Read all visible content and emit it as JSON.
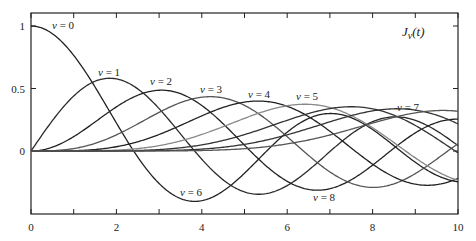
{
  "chart_data": {
    "type": "line",
    "annotation_title": "Jv(t)",
    "xlabel": "",
    "ylabel": "",
    "xlim": [
      0,
      10
    ],
    "ylim": [
      -0.5,
      1.1
    ],
    "grid": false,
    "legend": "inline labels",
    "x_ticks": [
      0,
      2,
      4,
      6,
      8,
      10
    ],
    "x_minor_ticks": [
      1,
      3,
      5,
      7,
      9
    ],
    "y_ticks": [
      {
        "value": 1,
        "label": "1"
      },
      {
        "value": 0.5,
        "label": "0.5"
      },
      {
        "value": 0,
        "label": "0"
      }
    ],
    "series": [
      {
        "name": "v = 0",
        "order": 0,
        "color": "#222222",
        "label_pos": [
          52,
          29
        ],
        "x": [
          0,
          1,
          2,
          3,
          4,
          5,
          6,
          7,
          8,
          9,
          10
        ],
        "values": [
          1.0,
          0.765,
          0.224,
          -0.26,
          -0.397,
          -0.178,
          0.151,
          0.3,
          0.172,
          -0.09,
          -0.246
        ]
      },
      {
        "name": "v = 1",
        "order": 1,
        "color": "#2a2a2a",
        "label_pos": [
          98,
          76
        ],
        "x": [
          0,
          1,
          2,
          3,
          4,
          5,
          6,
          7,
          8,
          9,
          10
        ],
        "values": [
          0.0,
          0.44,
          0.577,
          0.339,
          -0.066,
          -0.328,
          -0.277,
          -0.005,
          0.235,
          0.245,
          0.043
        ]
      },
      {
        "name": "v = 2",
        "order": 2,
        "color": "#222222",
        "label_pos": [
          150,
          85
        ],
        "x": [
          0,
          1,
          2,
          3,
          4,
          5,
          6,
          7,
          8,
          9,
          10
        ],
        "values": [
          0.0,
          0.115,
          0.353,
          0.486,
          0.364,
          0.047,
          -0.243,
          -0.301,
          -0.113,
          0.145,
          0.255
        ]
      },
      {
        "name": "v = 3",
        "order": 3,
        "color": "#555555",
        "label_pos": [
          200,
          93
        ],
        "x": [
          0,
          1,
          2,
          3,
          4,
          5,
          6,
          7,
          8,
          9,
          10
        ],
        "values": [
          0.0,
          0.02,
          0.129,
          0.309,
          0.43,
          0.365,
          0.115,
          -0.168,
          -0.291,
          -0.181,
          0.058
        ]
      },
      {
        "name": "v = 4",
        "order": 4,
        "color": "#222222",
        "label_pos": [
          248,
          98
        ],
        "x": [
          0,
          1,
          2,
          3,
          4,
          5,
          6,
          7,
          8,
          9,
          10
        ],
        "values": [
          0.0,
          0.002,
          0.034,
          0.132,
          0.281,
          0.391,
          0.358,
          0.158,
          -0.105,
          -0.265,
          -0.22
        ]
      },
      {
        "name": "v = 5",
        "order": 5,
        "color": "#888888",
        "label_pos": [
          296,
          100
        ],
        "x": [
          0,
          1,
          2,
          3,
          4,
          5,
          6,
          7,
          8,
          9,
          10
        ],
        "values": [
          0.0,
          0.0,
          0.007,
          0.043,
          0.132,
          0.261,
          0.362,
          0.348,
          0.186,
          -0.055,
          -0.234
        ]
      },
      {
        "name": "v = 6",
        "order": 6,
        "color": "#333333",
        "label_pos": [
          180,
          196
        ],
        "x": [
          0,
          1,
          2,
          3,
          4,
          5,
          6,
          7,
          8,
          9,
          10
        ],
        "values": [
          0.0,
          0.0,
          0.001,
          0.011,
          0.049,
          0.131,
          0.246,
          0.339,
          0.338,
          0.204,
          -0.014
        ]
      },
      {
        "name": "v = 7",
        "order": 7,
        "color": "#333333",
        "label_pos": [
          397,
          111
        ],
        "x": [
          0,
          1,
          2,
          3,
          4,
          5,
          6,
          7,
          8,
          9,
          10
        ],
        "values": [
          0.0,
          0.0,
          0.0,
          0.003,
          0.015,
          0.053,
          0.13,
          0.234,
          0.321,
          0.327,
          0.217
        ]
      },
      {
        "name": "v = 8",
        "order": 8,
        "color": "#555555",
        "label_pos": [
          313,
          201
        ],
        "x": [
          0,
          1,
          2,
          3,
          4,
          5,
          6,
          7,
          8,
          9,
          10
        ],
        "values": [
          0.0,
          0.0,
          0.0,
          0.001,
          0.004,
          0.018,
          0.057,
          0.128,
          0.223,
          0.305,
          0.318
        ]
      }
    ]
  },
  "plot": {
    "width": 476,
    "height": 241,
    "frame": {
      "left": 31,
      "top": 13,
      "right": 458,
      "bottom": 214
    },
    "t_min": 0,
    "t_max": 10,
    "y_pixel_at_0": 151,
    "y_pixel_per_unit": 125
  }
}
